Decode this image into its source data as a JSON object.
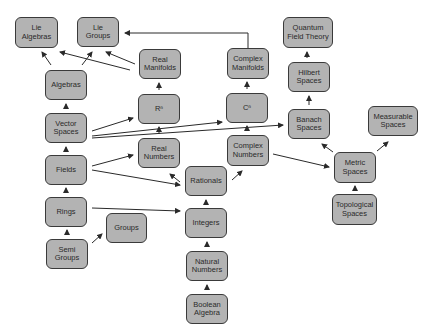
{
  "diagram": {
    "colors": {
      "node_fill": "#b3b3b3",
      "node_border": "#3a3a3a",
      "edge": "#2a2a2a",
      "background": "#ffffff"
    },
    "nodes": [
      {
        "id": "lie_algebras",
        "label": "Lie\nAlgebras",
        "x": 15,
        "y": 17,
        "w": 43,
        "h": 31
      },
      {
        "id": "lie_groups",
        "label": "Lie\nGroups",
        "x": 77,
        "y": 17,
        "w": 42,
        "h": 30
      },
      {
        "id": "real_manifolds",
        "label": "Real\nManifolds",
        "x": 139,
        "y": 49,
        "w": 42,
        "h": 30
      },
      {
        "id": "complex_manifolds",
        "label": "Complex\nManifolds",
        "x": 227,
        "y": 48,
        "w": 42,
        "h": 31
      },
      {
        "id": "qft",
        "label": "Quantum\nField Theory",
        "x": 283,
        "y": 17,
        "w": 50,
        "h": 31
      },
      {
        "id": "algebras",
        "label": "Algebras",
        "x": 45,
        "y": 70,
        "w": 42,
        "h": 30
      },
      {
        "id": "rn",
        "label": "Rⁿ",
        "x": 138,
        "y": 94,
        "w": 42,
        "h": 30
      },
      {
        "id": "cn",
        "label": "Cⁿ",
        "x": 226,
        "y": 93,
        "w": 42,
        "h": 30
      },
      {
        "id": "hilbert",
        "label": "Hilbert\nSpaces",
        "x": 288,
        "y": 62,
        "w": 42,
        "h": 30
      },
      {
        "id": "banach",
        "label": "Banach\nSpaces",
        "x": 288,
        "y": 109,
        "w": 42,
        "h": 30
      },
      {
        "id": "measurable",
        "label": "Measurable\nSpaces",
        "x": 368,
        "y": 106,
        "w": 50,
        "h": 30
      },
      {
        "id": "vector_spaces",
        "label": "Vector\nSpaces",
        "x": 45,
        "y": 113,
        "w": 42,
        "h": 30
      },
      {
        "id": "real_numbers",
        "label": "Real\nNumbers",
        "x": 138,
        "y": 138,
        "w": 42,
        "h": 30
      },
      {
        "id": "complex_numbers",
        "label": "Complex\nNumbers",
        "x": 227,
        "y": 135,
        "w": 42,
        "h": 31
      },
      {
        "id": "fields",
        "label": "Fields",
        "x": 45,
        "y": 155,
        "w": 42,
        "h": 30
      },
      {
        "id": "rationals",
        "label": "Rationals",
        "x": 185,
        "y": 166,
        "w": 42,
        "h": 30
      },
      {
        "id": "metric",
        "label": "Metric\nSpaces",
        "x": 334,
        "y": 152,
        "w": 42,
        "h": 31
      },
      {
        "id": "rings",
        "label": "Rings",
        "x": 45,
        "y": 197,
        "w": 42,
        "h": 30
      },
      {
        "id": "groups",
        "label": "Groups",
        "x": 106,
        "y": 213,
        "w": 41,
        "h": 30
      },
      {
        "id": "integers",
        "label": "Integers",
        "x": 185,
        "y": 208,
        "w": 42,
        "h": 30
      },
      {
        "id": "topological",
        "label": "Topological\nSpaces",
        "x": 332,
        "y": 194,
        "w": 45,
        "h": 31
      },
      {
        "id": "semi_groups",
        "label": "Semi\nGroups",
        "x": 46,
        "y": 239,
        "w": 42,
        "h": 30
      },
      {
        "id": "natural_numbers",
        "label": "Natural\nNumbers",
        "x": 186,
        "y": 251,
        "w": 42,
        "h": 30
      },
      {
        "id": "boolean_algebra",
        "label": "Boolean\nAlgebra",
        "x": 186,
        "y": 294,
        "w": 42,
        "h": 30
      }
    ],
    "edges": [
      {
        "from": "algebras",
        "to": "lie_algebras",
        "points": [
          [
            51,
            65
          ],
          [
            42,
            52
          ]
        ]
      },
      {
        "from": "algebras",
        "to": "lie_groups",
        "points": [
          [
            82,
            65
          ],
          [
            92,
            52
          ]
        ]
      },
      {
        "from": "real_manifolds",
        "to": "lie_groups",
        "points": [
          [
            135,
            64
          ],
          [
            106,
            52
          ]
        ]
      },
      {
        "from": "real_manifolds",
        "to": "lie_algebras",
        "points": [
          [
            130,
            70
          ],
          [
            60,
            52
          ]
        ]
      },
      {
        "from": "complex_manifolds",
        "to": "lie_groups",
        "points": [
          [
            248,
            48
          ],
          [
            248,
            33
          ],
          [
            125,
            33
          ]
        ]
      },
      {
        "from": "rn",
        "to": "real_manifolds",
        "points": [
          [
            159,
            90
          ],
          [
            159,
            83
          ]
        ]
      },
      {
        "from": "cn",
        "to": "complex_manifolds",
        "points": [
          [
            247,
            89
          ],
          [
            247,
            82
          ]
        ]
      },
      {
        "from": "banach",
        "to": "hilbert",
        "points": [
          [
            309,
            105
          ],
          [
            309,
            96
          ]
        ]
      },
      {
        "from": "hilbert",
        "to": "qft",
        "points": [
          [
            307,
            58
          ],
          [
            307,
            52
          ]
        ]
      },
      {
        "from": "vector_spaces",
        "to": "algebras",
        "points": [
          [
            66,
            109
          ],
          [
            66,
            104
          ]
        ]
      },
      {
        "from": "vector_spaces",
        "to": "rn",
        "points": [
          [
            92,
            131
          ],
          [
            133,
            118
          ]
        ]
      },
      {
        "from": "vector_spaces",
        "to": "cn",
        "points": [
          [
            92,
            136
          ],
          [
            222,
            122
          ]
        ]
      },
      {
        "from": "vector_spaces",
        "to": "banach",
        "points": [
          [
            92,
            138
          ],
          [
            283,
            125
          ]
        ]
      },
      {
        "from": "real_numbers",
        "to": "rn",
        "points": [
          [
            159,
            134
          ],
          [
            159,
            127
          ]
        ]
      },
      {
        "from": "complex_numbers",
        "to": "cn",
        "points": [
          [
            247,
            131
          ],
          [
            247,
            126
          ]
        ]
      },
      {
        "from": "fields",
        "to": "vector_spaces",
        "points": [
          [
            66,
            151
          ],
          [
            66,
            147
          ]
        ]
      },
      {
        "from": "fields",
        "to": "real_numbers",
        "points": [
          [
            92,
            166
          ],
          [
            133,
            155
          ]
        ]
      },
      {
        "from": "fields",
        "to": "rationals",
        "points": [
          [
            92,
            170
          ],
          [
            180,
            185
          ]
        ]
      },
      {
        "from": "rationals",
        "to": "real_numbers",
        "points": [
          [
            180,
            182
          ],
          [
            170,
            174
          ]
        ]
      },
      {
        "from": "rationals",
        "to": "complex_numbers",
        "points": [
          [
            232,
            180
          ],
          [
            242,
            171
          ]
        ]
      },
      {
        "from": "complex_numbers",
        "to": "metric",
        "points": [
          [
            273,
            154
          ],
          [
            329,
            167
          ]
        ]
      },
      {
        "from": "metric",
        "to": "banach",
        "points": [
          [
            333,
            152
          ],
          [
            322,
            144
          ]
        ]
      },
      {
        "from": "metric",
        "to": "measurable",
        "points": [
          [
            377,
            151
          ],
          [
            388,
            142
          ]
        ]
      },
      {
        "from": "topological",
        "to": "metric",
        "points": [
          [
            355,
            190
          ],
          [
            355,
            186
          ]
        ]
      },
      {
        "from": "rings",
        "to": "fields",
        "points": [
          [
            66,
            193
          ],
          [
            66,
            188
          ]
        ]
      },
      {
        "from": "rings",
        "to": "integers",
        "points": [
          [
            92,
            208
          ],
          [
            180,
            211
          ]
        ]
      },
      {
        "from": "semi_groups",
        "to": "rings",
        "points": [
          [
            67,
            235
          ],
          [
            67,
            230
          ]
        ]
      },
      {
        "from": "semi_groups",
        "to": "groups",
        "points": [
          [
            92,
            243
          ],
          [
            102,
            234
          ]
        ]
      },
      {
        "from": "integers",
        "to": "rationals",
        "points": [
          [
            206,
            204
          ],
          [
            206,
            200
          ]
        ]
      },
      {
        "from": "natural_numbers",
        "to": "integers",
        "points": [
          [
            207,
            247
          ],
          [
            207,
            242
          ]
        ]
      },
      {
        "from": "boolean_algebra",
        "to": "natural_numbers",
        "points": [
          [
            207,
            290
          ],
          [
            207,
            285
          ]
        ]
      }
    ]
  }
}
